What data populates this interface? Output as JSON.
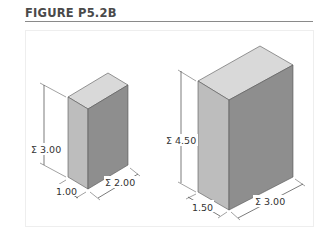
{
  "figure": {
    "title": "FIGURE P5.2B"
  },
  "colors": {
    "top_face": "#d9d9d9",
    "left_face": "#bcbcbc",
    "right_face": "#8f8f8f",
    "edge": "#555555",
    "dim_line": "#444444"
  },
  "boxes": [
    {
      "name": "small-box",
      "height_label": "Σ 3.00",
      "depth_label": "1.00",
      "width_label": "Σ 2.00"
    },
    {
      "name": "large-box",
      "height_label": "Σ 4.50",
      "depth_label": "1.50",
      "width_label": "Σ 3.00"
    }
  ]
}
